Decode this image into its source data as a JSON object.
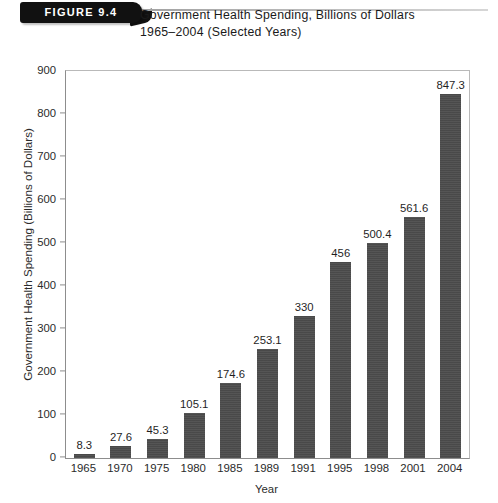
{
  "figure": {
    "tag": "FIGURE 9.4",
    "title_line1": "Government Health Spending, Billions of Dollars",
    "title_line2": "1965–2004 (Selected Years)"
  },
  "chart_data": {
    "type": "bar",
    "title": "Government Health Spending, Billions of Dollars 1965–2004 (Selected Years)",
    "xlabel": "Year",
    "ylabel": "Government Health Spending (Billions of Dollars)",
    "ylim": [
      0,
      900
    ],
    "ytick_step": 100,
    "yticks": [
      0,
      100,
      200,
      300,
      400,
      500,
      600,
      700,
      800,
      900
    ],
    "ytick_labels": [
      "0",
      "100",
      "200",
      "300",
      "400",
      "500",
      "600",
      "700",
      "800",
      "900"
    ],
    "grid": false,
    "legend": null,
    "bar_color": "#4d4d4d",
    "categories": [
      "1965",
      "1970",
      "1975",
      "1980",
      "1985",
      "1989",
      "1991",
      "1995",
      "1998",
      "2001",
      "2004"
    ],
    "values": [
      8.3,
      27.6,
      45.3,
      105.1,
      174.6,
      253.1,
      330,
      456,
      500.4,
      561.6,
      847.3
    ],
    "value_labels": [
      "8.3",
      "27.6",
      "45.3",
      "105.1",
      "174.6",
      "253.1",
      "330",
      "456",
      "500.4",
      "561.6",
      "847.3"
    ]
  }
}
